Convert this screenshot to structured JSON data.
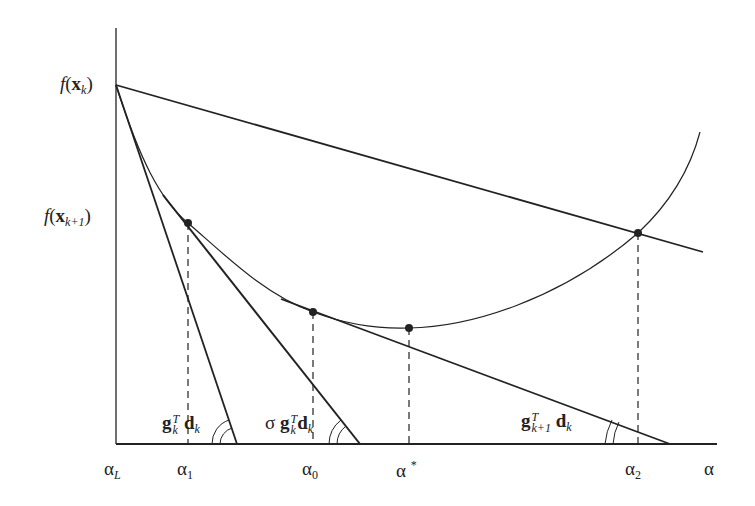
{
  "figure": {
    "type": "line-search-diagram",
    "y_labels": {
      "f_xk": {
        "func": "f",
        "arg": "x",
        "sub": "k"
      },
      "f_xk1": {
        "func": "f",
        "arg": "x",
        "sub": "k+1"
      }
    },
    "x_labels": {
      "alpha_L": {
        "sym": "α",
        "sub": "L"
      },
      "alpha_1": {
        "sym": "α",
        "sub": "1"
      },
      "alpha_0": {
        "sym": "α",
        "sub": "0"
      },
      "alpha_star": {
        "sym": "α",
        "sup": "*"
      },
      "alpha_2": {
        "sym": "α",
        "sub": "2"
      },
      "alpha": {
        "sym": "α"
      }
    },
    "slope_labels": {
      "gk_dk": {
        "g": "g",
        "sub": "k",
        "sup": "T",
        "d": "d",
        "dsub": "k"
      },
      "sigma_gk_dk": {
        "sigma": "σ",
        "g": "g",
        "sub": "k",
        "sup": "T",
        "d": "d",
        "dsub": "k"
      },
      "gk1_dk": {
        "g": "g",
        "sub": "k+1",
        "sup": "T",
        "d": "d",
        "dsub": "k"
      }
    },
    "points": [
      {
        "name": "alpha_1",
        "x": 188,
        "y": 223
      },
      {
        "name": "alpha_0",
        "x": 313,
        "y": 312
      },
      {
        "name": "alpha_star",
        "x": 409,
        "y": 328
      },
      {
        "name": "alpha_2",
        "x": 638,
        "y": 233
      }
    ],
    "colors": {
      "ink": "#222222",
      "background": "#ffffff"
    }
  }
}
